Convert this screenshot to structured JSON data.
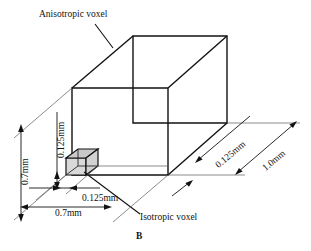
{
  "figure": {
    "caption": "B",
    "callouts": {
      "anisotropic": "Anisotropic voxel",
      "isotropic": "Isotropic voxel"
    },
    "dimensions": {
      "left_height": "0.7mm",
      "left_small_height": "0.125mm",
      "bottom_small_width": "0.125mm",
      "bottom_width": "0.7mm",
      "right_depth_small": "0.125mm",
      "right_depth": "1.0mm"
    },
    "colors": {
      "stroke": "#121212",
      "thin_stroke": "#3a3a3a",
      "voxel_fill": "#d9d9d9",
      "voxel_fill_dark": "#c4c4c4",
      "background": "#ffffff"
    }
  }
}
